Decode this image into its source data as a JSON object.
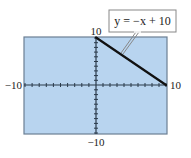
{
  "chart_data": {
    "type": "line",
    "title": "",
    "xlabel": "",
    "ylabel": "",
    "xlim": [
      -10,
      10
    ],
    "ylim": [
      -10,
      10
    ],
    "grid": false,
    "x_tick_spacing": 1,
    "y_tick_spacing": 1,
    "tick_labels": {
      "x_min": "−10",
      "x_max": "10",
      "y_min": "−10",
      "y_max": "10"
    },
    "series": [
      {
        "name": "y = −x + 10",
        "equation": "y = -x + 10",
        "x": [
          0,
          10
        ],
        "y": [
          10,
          0
        ]
      }
    ],
    "annotations": [
      {
        "text": "y = −x + 10",
        "points_to": [
          2.5,
          7.5
        ]
      }
    ],
    "legend_position": "callout top-right"
  },
  "colors": {
    "plot_background": "#b8d4ef",
    "plot_border": "#6b7f93",
    "axis": "#2a3a4a",
    "line": "#111111",
    "callout_border": "#888888",
    "callout_bg": "#ffffff"
  },
  "labels": {
    "x_min": "−10",
    "x_max": "10",
    "y_min": "−10",
    "y_max": "10",
    "callout": "y = −x + 10"
  }
}
